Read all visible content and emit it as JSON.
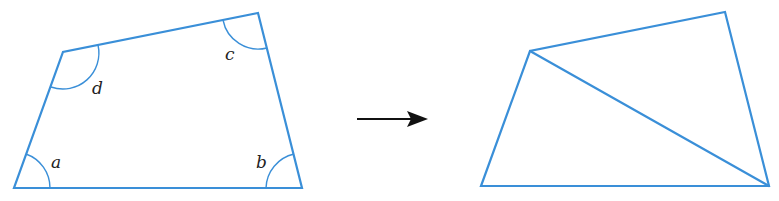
{
  "figure": {
    "left_shape": {
      "name": "quadrilateral",
      "vertices": {
        "A": [
          14,
          188
        ],
        "B": [
          302,
          188
        ],
        "C": [
          258,
          13
        ],
        "D": [
          63,
          52
        ]
      },
      "angle_labels": [
        {
          "vertex": "A",
          "label": "a"
        },
        {
          "vertex": "B",
          "label": "b"
        },
        {
          "vertex": "C",
          "label": "c"
        },
        {
          "vertex": "D",
          "label": "d"
        }
      ]
    },
    "arrow": {
      "from": [
        357,
        119
      ],
      "to": [
        427,
        119
      ],
      "direction": "right"
    },
    "right_shape": {
      "name": "quadrilateral divided by diagonal into two triangles",
      "vertices": {
        "A": [
          481,
          186
        ],
        "B": [
          769,
          186
        ],
        "C": [
          725,
          12
        ],
        "D": [
          530,
          51
        ]
      },
      "diagonal": [
        "D",
        "B"
      ]
    },
    "colors": {
      "shape_stroke": "#3a8fd8",
      "arrow": "#111111",
      "label": "#222222",
      "background": "#ffffff"
    }
  }
}
